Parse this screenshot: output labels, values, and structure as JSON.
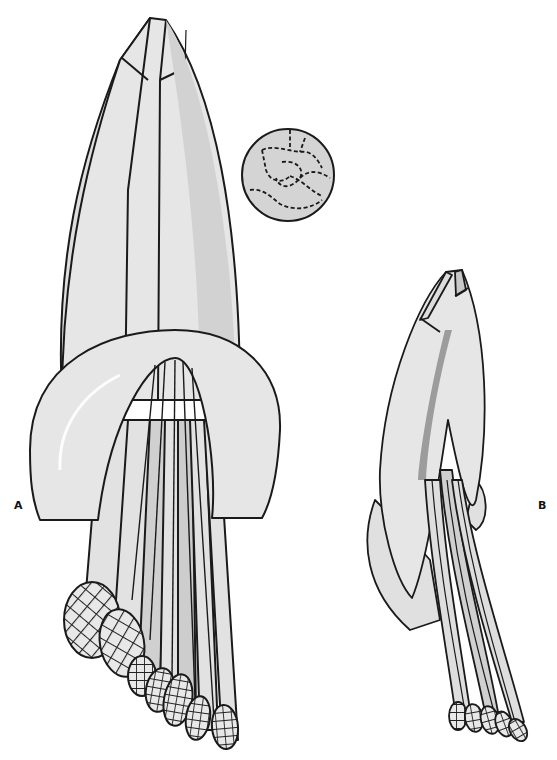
{
  "figure": {
    "panels": [
      {
        "id": "A",
        "label": "A",
        "description": "large illustration: enclosing bract-like structure with a curved collar and a bundle of elongated stalks ending in reticulate (net-patterned) oval tips"
      },
      {
        "id": "B",
        "label": "B",
        "description": "smaller side-view illustration of the same structure with stalks curving to lower right ending in reticulate tips"
      }
    ],
    "inset": {
      "description": "circular inset showing dashed cell-wall network pattern"
    },
    "colors": {
      "outline": "#1a1a1a",
      "fill_light": "#e4e4e4",
      "fill_mid": "#cfcfcf",
      "fill_dark": "#a8a8a8",
      "background": "#ffffff"
    }
  }
}
